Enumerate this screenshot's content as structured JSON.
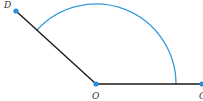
{
  "diagram": {
    "type": "angle-arc",
    "points": {
      "D": {
        "label": "D",
        "x": 16,
        "y": 11
      },
      "O": {
        "label": "O",
        "x": 96,
        "y": 84
      },
      "C": {
        "label": "C",
        "x": 202,
        "y": 84
      }
    },
    "segments": [
      {
        "from": "O",
        "to": "D"
      },
      {
        "from": "O",
        "to": "C"
      }
    ],
    "arc": {
      "center": "O",
      "radius": 80,
      "color": "#3a9ad9"
    },
    "colors": {
      "line": "#1a1a1a",
      "point": "#2a8fd8",
      "arc": "#3a9ad9",
      "label": "#333333"
    }
  }
}
